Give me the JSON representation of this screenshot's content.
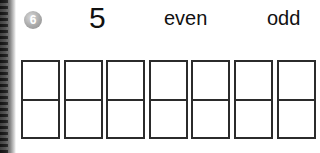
{
  "exercise": {
    "badge_number": "6",
    "number": "5",
    "labels": {
      "even": "even",
      "odd": "odd"
    },
    "box_count": 7,
    "boxes": [
      {
        "top": "",
        "bottom": ""
      },
      {
        "top": "",
        "bottom": ""
      },
      {
        "top": "",
        "bottom": ""
      },
      {
        "top": "",
        "bottom": ""
      },
      {
        "top": "",
        "bottom": ""
      },
      {
        "top": "",
        "bottom": ""
      },
      {
        "top": "",
        "bottom": ""
      }
    ]
  },
  "colors": {
    "badge": "#a9a9a9",
    "box_border": "#2b2b2b",
    "text": "#111111"
  }
}
